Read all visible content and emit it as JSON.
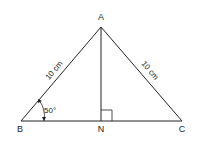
{
  "diagram": {
    "type": "triangle",
    "vertices": {
      "A": {
        "label": "A"
      },
      "B": {
        "label": "B"
      },
      "C": {
        "label": "C"
      },
      "N": {
        "label": "N"
      }
    },
    "sides": {
      "AB": "10 cm",
      "AC": "10 cm"
    },
    "angle_B": "50°",
    "right_angle_at": "N",
    "colors": {
      "stroke": "#222222",
      "background": "#ffffff"
    }
  }
}
